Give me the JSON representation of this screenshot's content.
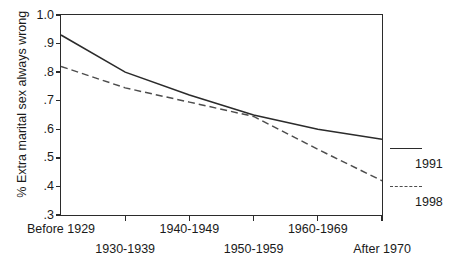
{
  "chart_data": {
    "type": "line",
    "title": "",
    "xlabel": "",
    "ylabel": "% Extra marital sex always wrong",
    "categories": [
      "Before 1929",
      "1930-1939",
      "1940-1949",
      "1950-1959",
      "1960-1969",
      "After 1970"
    ],
    "ylim": [
      0.3,
      1.0
    ],
    "ytick_labels": [
      "1.0",
      ".9",
      ".8",
      ".7",
      ".6",
      ".5",
      ".4",
      ".3"
    ],
    "ytick_values": [
      1.0,
      0.9,
      0.8,
      0.7,
      0.6,
      0.5,
      0.4,
      0.3
    ],
    "grid": false,
    "legend_position": "right",
    "series": [
      {
        "name": "1991",
        "style": "solid",
        "color": "#2b2b2b",
        "values": [
          0.93,
          0.8,
          0.72,
          0.65,
          0.6,
          0.565
        ]
      },
      {
        "name": "1998",
        "style": "dashed",
        "color": "#4d4d4d",
        "values": [
          0.82,
          0.745,
          0.695,
          0.645,
          0.53,
          0.42
        ]
      }
    ]
  },
  "axes": {
    "y_title": "% Extra marital sex always wrong"
  },
  "legend": {
    "entries": [
      {
        "label": "1991",
        "style": "solid"
      },
      {
        "label": "1998",
        "style": "dashed"
      }
    ]
  }
}
